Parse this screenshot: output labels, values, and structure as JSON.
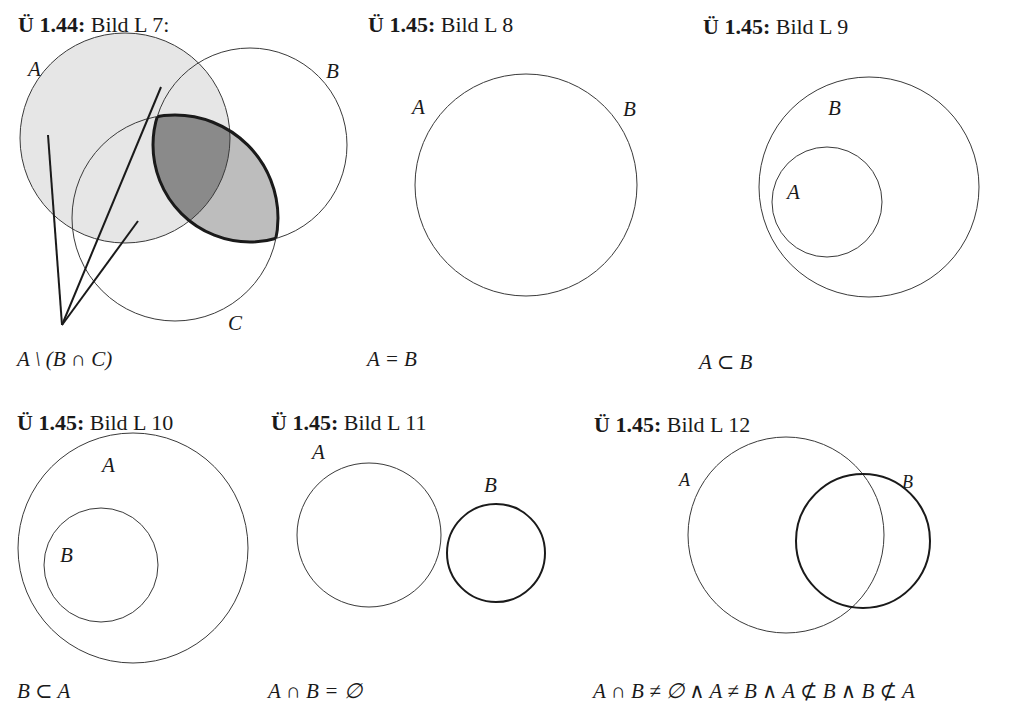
{
  "figures": [
    {
      "id": "L7",
      "heading_bold": "Ü 1.44:",
      "heading_rest": " Bild L 7:",
      "caption": "A \\ (B ∩ C)",
      "labels": {
        "A": "A",
        "B": "B",
        "C": "C"
      }
    },
    {
      "id": "L8",
      "heading_bold": "Ü 1.45:",
      "heading_rest": " Bild L 8",
      "caption": "A = B",
      "labels": {
        "A": "A",
        "B": "B"
      }
    },
    {
      "id": "L9",
      "heading_bold": "Ü 1.45:",
      "heading_rest": " Bild L 9",
      "caption": "A ⊂ B",
      "labels": {
        "A": "A",
        "B": "B"
      }
    },
    {
      "id": "L10",
      "heading_bold": "Ü 1.45:",
      "heading_rest": " Bild L 10",
      "caption": "B ⊂ A",
      "labels": {
        "A": "A",
        "B": "B"
      }
    },
    {
      "id": "L11",
      "heading_bold": "Ü 1.45:",
      "heading_rest": " Bild L 11",
      "caption": "A ∩ B = ∅",
      "labels": {
        "A": "A",
        "B": "B"
      }
    },
    {
      "id": "L12",
      "heading_bold": "Ü 1.45:",
      "heading_rest": " Bild L 12",
      "caption": "A ∩ B ≠ ∅ ∧ A ≠ B ∧ A ⊄ B ∧ B ⊄ A",
      "labels": {
        "A": "A",
        "B": "B"
      }
    }
  ],
  "colors": {
    "stroke": "#3a3a3a",
    "fill_light": "#e6e6e6",
    "fill_medium": "#bdbdbd",
    "fill_dark": "#8a8a8a"
  }
}
